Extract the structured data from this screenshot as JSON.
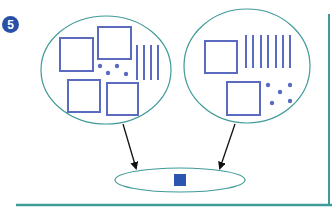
{
  "problem": {
    "number": "5"
  },
  "colors": {
    "ellipse_stroke": "#3f9a98",
    "shape_stroke": "#5b6cc0",
    "unit_fill": "#2a55b0",
    "badge_fill": "#2a4fa8",
    "frame": "#3f9a98",
    "arrow": "#111111"
  },
  "diagram": {
    "left_group": {
      "hundreds_squares": 4,
      "tens_lines": 4,
      "ones_dots": 4
    },
    "right_group": {
      "hundreds_squares": 2,
      "tens_lines": 7,
      "ones_dots": 5
    },
    "result_group": {
      "filled_unit_squares": 1
    }
  }
}
